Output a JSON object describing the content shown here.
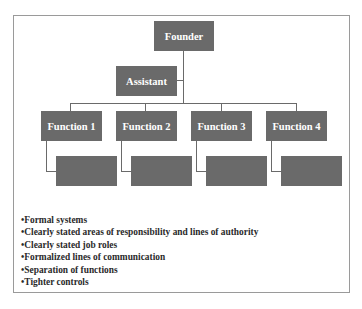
{
  "diagram": {
    "root": {
      "label": "Founder"
    },
    "assistant": {
      "label": "Assistant"
    },
    "functions": [
      {
        "label": "Function 1"
      },
      {
        "label": "Function 2"
      },
      {
        "label": "Function 3"
      },
      {
        "label": "Function 4"
      }
    ],
    "sub_boxes_count": 4,
    "box_color": "#6a6a6a",
    "text_color": "#ffffff"
  },
  "bullets": [
    "Formal systems",
    "Clearly stated areas of responsibility and lines of authority",
    "Clearly stated job roles",
    "Formalized lines of communication",
    "Separation of functions",
    "Tighter controls"
  ]
}
